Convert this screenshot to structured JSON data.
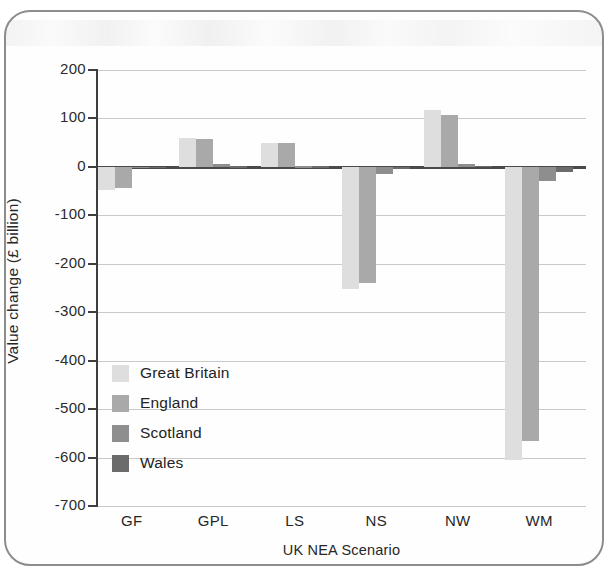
{
  "figure": {
    "frame_border_color": "#8d8d8d",
    "background": "#ffffff"
  },
  "chart_data": {
    "type": "bar",
    "title": "",
    "xlabel": "UK NEA Scenario",
    "ylabel": "Value change (£ billion)",
    "categories": [
      "GF",
      "GPL",
      "LS",
      "NS",
      "NW",
      "WM"
    ],
    "ylim": [
      -700,
      200
    ],
    "yticks": [
      200,
      100,
      0,
      -100,
      -200,
      -300,
      -400,
      -500,
      -600,
      -700
    ],
    "ytick_labels": [
      "200",
      "100",
      "0",
      "-100",
      "-200",
      "-300",
      "-400",
      "-500",
      "-600",
      "-700"
    ],
    "grid": true,
    "legend_position": "inside-lower-left",
    "series": [
      {
        "name": "Great Britain",
        "color": "#dedede",
        "values": [
          -48,
          60,
          50,
          -252,
          118,
          -605
        ]
      },
      {
        "name": "England",
        "color": "#a9a9a9",
        "values": [
          -44,
          57,
          50,
          -239,
          107,
          -565
        ]
      },
      {
        "name": "Scotland",
        "color": "#8e8e8e",
        "values": [
          -2,
          5,
          1,
          -15,
          5,
          -30
        ]
      },
      {
        "name": "Wales",
        "color": "#6b6b6b",
        "values": [
          -1,
          1,
          1,
          -4,
          2,
          -10
        ]
      }
    ]
  },
  "legend": {
    "entries": [
      {
        "label": "Great Britain",
        "color": "#dedede"
      },
      {
        "label": "England",
        "color": "#a9a9a9"
      },
      {
        "label": "Scotland",
        "color": "#8e8e8e"
      },
      {
        "label": "Wales",
        "color": "#6b6b6b"
      }
    ]
  }
}
